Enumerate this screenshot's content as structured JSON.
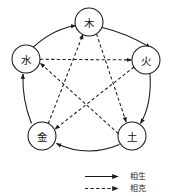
{
  "diagram": {
    "background_color": "#ffffff",
    "stroke_color": "#1a1a1a",
    "nodes": [
      {
        "id": "wood",
        "label": "木",
        "cx": 89,
        "cy": 22,
        "r": 14
      },
      {
        "id": "fire",
        "label": "火",
        "cx": 146,
        "cy": 60,
        "r": 14
      },
      {
        "id": "earth",
        "label": "土",
        "cx": 132,
        "cy": 136,
        "r": 14
      },
      {
        "id": "metal",
        "label": "金",
        "cx": 42,
        "cy": 136,
        "r": 14
      },
      {
        "id": "water",
        "label": "水",
        "cx": 26,
        "cy": 59,
        "r": 14
      }
    ],
    "sheng_edges": [
      {
        "from": "wood",
        "to": "fire",
        "style": "solid"
      },
      {
        "from": "fire",
        "to": "earth",
        "style": "solid"
      },
      {
        "from": "earth",
        "to": "metal",
        "style": "solid"
      },
      {
        "from": "metal",
        "to": "water",
        "style": "solid"
      },
      {
        "from": "water",
        "to": "wood",
        "style": "solid"
      }
    ],
    "ke_edges": [
      {
        "from": "wood",
        "to": "earth",
        "style": "dashed"
      },
      {
        "from": "earth",
        "to": "water",
        "style": "dashed"
      },
      {
        "from": "water",
        "to": "fire",
        "style": "dashed"
      },
      {
        "from": "fire",
        "to": "metal",
        "style": "dashed"
      },
      {
        "from": "metal",
        "to": "wood",
        "style": "dashed"
      }
    ]
  },
  "legend": {
    "items": [
      {
        "id": "sheng",
        "style": "solid",
        "label": "相生"
      },
      {
        "id": "ke",
        "style": "dashed",
        "label": "相克"
      }
    ]
  }
}
